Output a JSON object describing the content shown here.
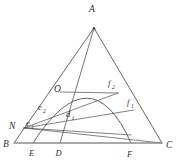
{
  "figure": {
    "kind": "geometry-diagram",
    "background_color": "#ffffff",
    "stroke_color": "#4a4a4a",
    "baseline_color": "#8c8c8c",
    "label_color": "#2f2f2f",
    "width": 178,
    "height": 161
  },
  "vertices": [
    {
      "id": "A",
      "label": "A",
      "x": 94.0,
      "y": 28.0,
      "label_x": 92.0,
      "label_y": 12.0
    },
    {
      "id": "B",
      "label": "B",
      "x": 14.0,
      "y": 143.0,
      "label_x": 3.0,
      "label_y": 146.5
    },
    {
      "id": "C",
      "label": "C",
      "x": 162.0,
      "y": 143.0,
      "label_x": 166.0,
      "label_y": 147.5
    }
  ],
  "base_points": [
    {
      "id": "E",
      "label": "E",
      "x": 33.0,
      "y": 143.0,
      "label_x": 29.0,
      "label_y": 156.0
    },
    {
      "id": "D",
      "label": "D",
      "x": 60.0,
      "y": 143.0,
      "label_x": 55.5,
      "label_y": 156.0
    },
    {
      "id": "F",
      "label": "F",
      "x": 131.0,
      "y": 143.0,
      "label_x": 127.0,
      "label_y": 156.5
    }
  ],
  "interior_points": [
    {
      "id": "N",
      "label": "N",
      "x": 24.0,
      "y": 128.0,
      "label_x": 9.0,
      "label_y": 129.0
    },
    {
      "id": "O",
      "label": "O",
      "x": 60.5,
      "y": 88.5,
      "label_x": 54.0,
      "label_y": 92.0
    }
  ],
  "segment_labels": [
    {
      "id": "e1",
      "base": "e",
      "subscript": "1",
      "label": "e₁",
      "x": 27.0,
      "y": 126.0
    },
    {
      "id": "e2",
      "base": "e",
      "subscript": "2",
      "label": "e₂",
      "x": 40.0,
      "y": 110.0
    },
    {
      "id": "d1",
      "base": "d",
      "subscript": "1",
      "label": "d₁",
      "x": 68.0,
      "y": 117.0
    },
    {
      "id": "f1",
      "base": "f",
      "subscript": "1",
      "label": "f₁",
      "x": 129.0,
      "y": 105.0
    },
    {
      "id": "f2",
      "base": "f",
      "subscript": "2",
      "label": "f₂",
      "x": 110.0,
      "y": 86.0
    }
  ],
  "edges": [
    {
      "id": "AB",
      "from": "A",
      "to": "B",
      "role": "triangle-side"
    },
    {
      "id": "AC",
      "from": "A",
      "to": "C",
      "role": "triangle-side"
    },
    {
      "id": "BC",
      "from": "B",
      "to": "C",
      "role": "triangle-base"
    },
    {
      "id": "AD",
      "from": "A",
      "to": "D",
      "role": "cevian"
    }
  ],
  "rays_from_N": [
    {
      "id": "NF",
      "from": "N",
      "to": "F",
      "role": "chord"
    },
    {
      "id": "NC",
      "from": "N",
      "to": "C",
      "role": "chord"
    },
    {
      "id": "Nf1",
      "from": "N",
      "to": "f1-point",
      "role": "chord"
    },
    {
      "id": "Nf2",
      "from": "N",
      "to": "f2-point",
      "role": "chord"
    }
  ],
  "arc": {
    "id": "arc-EF",
    "role": "parabolic-arc",
    "from": "E",
    "to": "F",
    "apex_x": 90.0,
    "apex_y": 85.0
  }
}
